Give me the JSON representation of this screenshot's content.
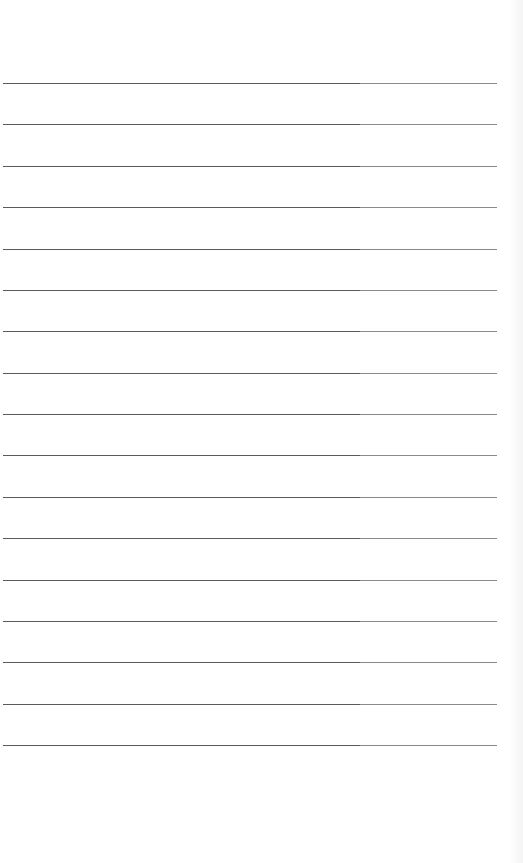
{
  "document": {
    "type": "blank lined page",
    "line_count": 17,
    "first_line_y": 83,
    "line_spacing": 41.375,
    "colors": {
      "background": "#ffffff",
      "rule_dark": "#5a5a5a",
      "rule_light": "#8a8a8a"
    }
  }
}
